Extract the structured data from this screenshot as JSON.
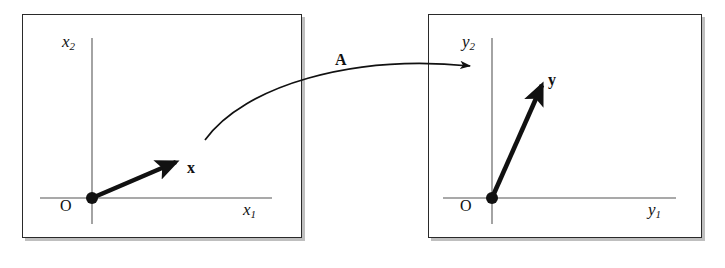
{
  "figure": {
    "background_color": "#ffffff",
    "line_color": "#111111",
    "panel_border_color": "#2a2a2a",
    "panel_shadow_color": "#bfbfbf"
  },
  "left_panel": {
    "name": "domain-panel",
    "origin_label": "O",
    "x_axis_label": "x",
    "x_axis_sub": "1",
    "y_axis_label": "x",
    "y_axis_sub": "2",
    "vector_label": "x",
    "vector_from": [
      92,
      198
    ],
    "vector_to": [
      175,
      163
    ]
  },
  "right_panel": {
    "name": "codomain-panel",
    "origin_label": "O",
    "x_axis_label": "y",
    "x_axis_sub": "1",
    "y_axis_label": "y",
    "y_axis_sub": "2",
    "vector_label": "y",
    "vector_from": [
      492,
      198
    ],
    "vector_to": [
      541,
      84
    ]
  },
  "mapping": {
    "name": "linear-map-arrow",
    "label": "A",
    "from": [
      205,
      140
    ],
    "to": [
      473,
      66
    ]
  }
}
